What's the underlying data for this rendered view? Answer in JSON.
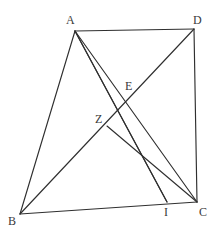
{
  "figure": {
    "type": "geometry-diagram",
    "width": 214,
    "height": 237,
    "background_color": "#ffffff",
    "line_color": "#2f2f2f",
    "label_color": "#3a3a3a",
    "points": [
      {
        "id": "A",
        "label": "A",
        "x": 75,
        "y": 31,
        "label_x": 66,
        "label_y": 14
      },
      {
        "id": "D",
        "label": "D",
        "x": 194,
        "y": 29,
        "label_x": 193,
        "label_y": 14
      },
      {
        "id": "B",
        "label": "B",
        "x": 20,
        "y": 214,
        "label_x": 8,
        "label_y": 215
      },
      {
        "id": "C",
        "label": "C",
        "x": 197,
        "y": 202,
        "label_x": 199,
        "label_y": 206
      },
      {
        "id": "I",
        "label": "I",
        "x": 167,
        "y": 202,
        "label_x": 164,
        "label_y": 206
      },
      {
        "id": "E",
        "label": "E",
        "x": 131,
        "y": 100,
        "label_x": 125,
        "label_y": 80
      },
      {
        "id": "Z",
        "label": "Z",
        "x": 107,
        "y": 126,
        "label_x": 95,
        "label_y": 113
      }
    ],
    "segments": [
      {
        "name": "A-D",
        "from": "A",
        "to": "D"
      },
      {
        "name": "D-C",
        "from": "D",
        "to": "C"
      },
      {
        "name": "B-C",
        "from": "B",
        "to": "C"
      },
      {
        "name": "A-B",
        "from": "A",
        "to": "B"
      },
      {
        "name": "B-D",
        "from": "B",
        "to": "D"
      },
      {
        "name": "A-C",
        "from": "A",
        "to": "C"
      },
      {
        "name": "A-I",
        "from": "A",
        "to": "I"
      },
      {
        "name": "A-I-second",
        "from": "A",
        "to": "I"
      },
      {
        "name": "Z-C",
        "from": "Z",
        "to": "C"
      }
    ]
  }
}
